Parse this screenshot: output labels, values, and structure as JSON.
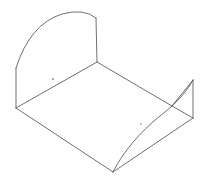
{
  "document": {
    "title": "Isometric Line Drawing",
    "kind": "technical-line-drawing",
    "background_color": "#ffffff",
    "line_color": "#555555",
    "line_width": 0.85,
    "vertex_dot_color": "#8a8a8a",
    "canvas": {
      "width": 206,
      "height": 190
    }
  },
  "geometry": {
    "description": "Isometric wireframe of a tray-like sheet part: curved arched back panel on the left, flat quadrilateral base, and a triangular flap on the right with a swept curved edge to the bottom vertex.",
    "points": {
      "arc_left_top": "16,68",
      "arc_apex": "72,13",
      "arc_right_top": "96,18",
      "panel_right_bottom": "97,62",
      "panel_left_bottom": "16,108",
      "base_bottom_vertex": "113,172",
      "base_right_vertex": "172,106",
      "flap_apex": "193,80",
      "flap_bottom_right": "193,118"
    },
    "paths": {
      "arc_top": "M 16 68 Q 30 24 62 14 Q 84 8 96 18",
      "panel_left_edge": "M 16 68 L 16 108",
      "panel_right_edge": "M 96 18 L 97 62",
      "base_top_left_edge": "M 16 108 L 97 62",
      "base_top_right_edge": "M 97 62 L 172 106",
      "base_bottom_left_edge": "M 16 108 L 113 172",
      "base_bottom_right_edge": "M 113 172 L 193 118",
      "flap_left_edge": "M 172 106 L 193 80",
      "flap_right_edge": "M 193 80 L 193 118",
      "flap_lower_edge": "M 172 106 L 193 118",
      "swept_curve": "M 113 172 C 123 152 140 132 160 116 C 170 108 183 98 193 80"
    },
    "vertex_dots": [
      {
        "name": "dot-upper-left",
        "cx": 53,
        "cy": 79,
        "r": 0.9
      },
      {
        "name": "dot-lower-right",
        "cx": 141,
        "cy": 124,
        "r": 0.8
      }
    ]
  }
}
